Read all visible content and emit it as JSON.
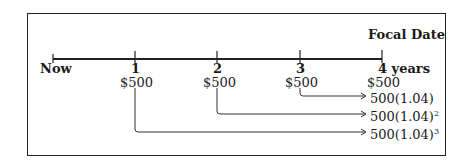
{
  "title": "Focal Date",
  "timeline": {
    "labels": [
      "Now",
      "1",
      "2",
      "3",
      "4 years"
    ],
    "payments": [
      "$500",
      "$500",
      "$500",
      "$500"
    ]
  },
  "accumulated_values": [
    {
      "base": "500(1.04)",
      "exponent": ""
    },
    {
      "base": "500(1.04)",
      "exponent": "2"
    },
    {
      "base": "500(1.04)",
      "exponent": "3"
    }
  ],
  "colors": {
    "line": "#222222",
    "text": "#1a1a1a"
  }
}
